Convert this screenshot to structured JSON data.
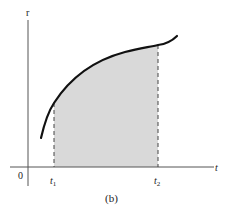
{
  "figure": {
    "caption": "(b)",
    "y_axis_label": "r",
    "x_axis_label": "t",
    "origin_label": "0",
    "tick_labels": {
      "t1_main": "t",
      "t1_sub": "1",
      "t2_main": "t",
      "t2_sub": "2"
    },
    "colors": {
      "axis": "#555555",
      "curve": "#111111",
      "shaded_area": "#d9d9d9",
      "dashed_lines": "#444444"
    }
  }
}
